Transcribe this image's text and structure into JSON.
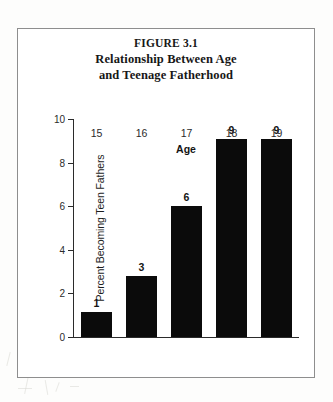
{
  "figure": {
    "number_label": "FIGURE 3.1",
    "title_line_1": "Relationship Between Age",
    "title_line_2": "and Teenage Fatherhood"
  },
  "chart_data": {
    "type": "bar",
    "title": "Relationship Between Age and Teenage Fatherhood",
    "figure_number": "FIGURE 3.1",
    "categories": [
      "15",
      "16",
      "17",
      "18",
      "19"
    ],
    "values": [
      1,
      3,
      6,
      9,
      9
    ],
    "bar_pixel_values": [
      1.15,
      2.8,
      6.0,
      9.1,
      9.1
    ],
    "data_labels": [
      "1",
      "3",
      "6",
      "9",
      "9"
    ],
    "xlabel": "Age",
    "ylabel": "Percent Becoming Teen Fathers",
    "ylim": [
      0,
      10
    ],
    "ytick_labels": [
      "0",
      "2",
      "4",
      "6",
      "8",
      "10"
    ],
    "ytick_values": [
      0,
      2,
      4,
      6,
      8,
      10
    ],
    "grid": false,
    "legend": null,
    "bar_color": "#0b0b0b",
    "axis_color": "#2b2b2b",
    "frame_color": "#8e8e8e"
  }
}
